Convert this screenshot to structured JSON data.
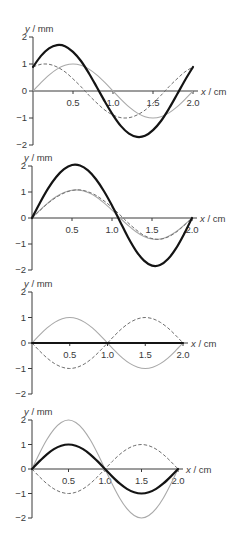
{
  "chart_data": [
    {
      "type": "line",
      "title": "",
      "xlabel": "x / cm",
      "ylabel": "y / mm",
      "xlim": [
        0,
        2.0
      ],
      "ylim": [
        -2,
        2
      ],
      "grid": false,
      "legend": null,
      "x_ticks": [
        0.5,
        1.0,
        1.5,
        2.0
      ],
      "x_tick_labels": [
        "0.5",
        "1.0",
        "1.5",
        "2.0"
      ],
      "y_ticks": [
        2,
        1,
        0,
        -1,
        -2
      ],
      "y_tick_labels": [
        "2",
        "1",
        "0",
        "−1",
        "−2"
      ],
      "x": [
        0,
        0.1,
        0.2,
        0.3,
        0.4,
        0.5,
        0.6,
        0.7,
        0.8,
        0.9,
        1.0,
        1.1,
        1.2,
        1.3,
        1.4,
        1.5,
        1.6,
        1.7,
        1.8,
        1.9,
        2.0
      ],
      "series": [
        {
          "name": "grey solid wave",
          "style": "grey-solid",
          "color": "#a9a9a9",
          "values": [
            0,
            0.31,
            0.59,
            0.81,
            0.95,
            1.0,
            0.95,
            0.81,
            0.59,
            0.31,
            0,
            -0.31,
            -0.59,
            -0.81,
            -0.95,
            -1.0,
            -0.95,
            -0.81,
            -0.59,
            -0.31,
            0
          ]
        },
        {
          "name": "dashed wave",
          "style": "dashed",
          "color": "#6f6f6f",
          "values": [
            0.89,
            0.99,
            0.99,
            0.89,
            0.71,
            0.45,
            0.16,
            -0.16,
            -0.45,
            -0.71,
            -0.89,
            -0.99,
            -0.99,
            -0.89,
            -0.71,
            -0.45,
            -0.16,
            0.16,
            0.45,
            0.71,
            0.89
          ]
        },
        {
          "name": "resultant (thick black)",
          "style": "thick",
          "color": "#141414",
          "values": [
            0.89,
            1.3,
            1.58,
            1.7,
            1.66,
            1.45,
            1.11,
            0.65,
            0.13,
            -0.4,
            -0.89,
            -1.3,
            -1.58,
            -1.7,
            -1.66,
            -1.45,
            -1.11,
            -0.65,
            -0.13,
            0.4,
            0.89
          ]
        }
      ]
    },
    {
      "type": "line",
      "title": "",
      "xlabel": "x / cm",
      "ylabel": "y / mm",
      "xlim": [
        0,
        2.0
      ],
      "ylim": [
        -2,
        2
      ],
      "grid": false,
      "legend": null,
      "x_ticks": [
        0.5,
        1.0,
        1.5,
        2.0
      ],
      "x_tick_labels": [
        "0.5",
        "1.0",
        "1.5",
        "2.0"
      ],
      "y_ticks": [
        2,
        1,
        0,
        -1,
        -2
      ],
      "y_tick_labels": [
        "2",
        "1",
        "0",
        "−1",
        "−2"
      ],
      "x": [
        0,
        0.1,
        0.2,
        0.3,
        0.4,
        0.5,
        0.6,
        0.7,
        0.8,
        0.9,
        1.0,
        1.1,
        1.2,
        1.3,
        1.4,
        1.5,
        1.6,
        1.7,
        1.8,
        1.9,
        2.0
      ],
      "series": [
        {
          "name": "grey solid wave",
          "style": "grey-solid",
          "color": "#a9a9a9",
          "values": [
            0,
            0.3,
            0.58,
            0.82,
            0.98,
            1.07,
            1.07,
            0.98,
            0.82,
            0.58,
            0.3,
            0,
            -0.28,
            -0.53,
            -0.71,
            -0.81,
            -0.81,
            -0.71,
            -0.53,
            -0.28,
            0
          ]
        },
        {
          "name": "dashed wave",
          "style": "dashed",
          "color": "#6f6f6f",
          "values": [
            0,
            0.29,
            0.57,
            0.79,
            0.96,
            1.06,
            1.08,
            1.01,
            0.87,
            0.66,
            0.41,
            0.12,
            -0.18,
            -0.45,
            -0.67,
            -0.79,
            -0.82,
            -0.73,
            -0.55,
            -0.29,
            0
          ]
        },
        {
          "name": "resultant (thick black)",
          "style": "thick",
          "color": "#141414",
          "values": [
            0,
            0.59,
            1.13,
            1.57,
            1.88,
            2.04,
            2.02,
            1.83,
            1.49,
            1.03,
            0.48,
            -0.13,
            -0.74,
            -1.26,
            -1.64,
            -1.83,
            -1.81,
            -1.58,
            -1.17,
            -0.62,
            0
          ]
        }
      ]
    },
    {
      "type": "line",
      "title": "",
      "xlabel": "x / cm",
      "ylabel": "y / mm",
      "xlim": [
        0,
        2.0
      ],
      "ylim": [
        -2,
        2
      ],
      "grid": false,
      "legend": null,
      "x_ticks": [
        0.5,
        1.0,
        1.5,
        2.0
      ],
      "x_tick_labels": [
        "0.5",
        "1.0",
        "1.5",
        "2.0"
      ],
      "y_ticks": [
        2,
        1,
        0,
        -1,
        -2
      ],
      "y_tick_labels": [
        "2",
        "1",
        "0",
        "−1",
        "−2"
      ],
      "x": [
        0,
        0.1,
        0.2,
        0.3,
        0.4,
        0.5,
        0.6,
        0.7,
        0.8,
        0.9,
        1.0,
        1.1,
        1.2,
        1.3,
        1.4,
        1.5,
        1.6,
        1.7,
        1.8,
        1.9,
        2.0
      ],
      "series": [
        {
          "name": "grey solid wave",
          "style": "grey-solid",
          "color": "#a9a9a9",
          "values": [
            0,
            0.31,
            0.59,
            0.81,
            0.95,
            1.0,
            0.95,
            0.81,
            0.59,
            0.31,
            0,
            -0.31,
            -0.59,
            -0.81,
            -0.95,
            -1.0,
            -0.95,
            -0.81,
            -0.59,
            -0.31,
            0
          ]
        },
        {
          "name": "dashed wave",
          "style": "dashed",
          "color": "#6f6f6f",
          "values": [
            0,
            -0.31,
            -0.59,
            -0.81,
            -0.95,
            -1.0,
            -0.95,
            -0.81,
            -0.59,
            -0.31,
            0,
            0.31,
            0.59,
            0.81,
            0.95,
            1.0,
            0.95,
            0.81,
            0.59,
            0.31,
            0
          ]
        },
        {
          "name": "resultant (thick black)",
          "style": "thick",
          "color": "#141414",
          "values": [
            0,
            0,
            0,
            0,
            0,
            0,
            0,
            0,
            0,
            0,
            0,
            0,
            0,
            0,
            0,
            0,
            0,
            0,
            0,
            0,
            0
          ]
        }
      ]
    },
    {
      "type": "line",
      "title": "",
      "xlabel": "x / cm",
      "ylabel": "y / mm",
      "xlim": [
        0,
        2.0
      ],
      "ylim": [
        -2,
        2
      ],
      "grid": false,
      "legend": null,
      "x_ticks": [
        0.5,
        1.0,
        1.5,
        2.0
      ],
      "x_tick_labels": [
        "0.5",
        "1.0",
        "1.5",
        "2.0"
      ],
      "y_ticks": [
        2,
        1,
        0,
        -1,
        -2
      ],
      "y_tick_labels": [
        "2",
        "1",
        "0",
        "−1",
        "−2"
      ],
      "x": [
        0,
        0.1,
        0.2,
        0.3,
        0.4,
        0.5,
        0.6,
        0.7,
        0.8,
        0.9,
        1.0,
        1.1,
        1.2,
        1.3,
        1.4,
        1.5,
        1.6,
        1.7,
        1.8,
        1.9,
        2.0
      ],
      "series": [
        {
          "name": "grey solid wave",
          "style": "grey-solid",
          "color": "#a9a9a9",
          "values": [
            0,
            0.62,
            1.18,
            1.62,
            1.9,
            2.0,
            1.9,
            1.62,
            1.18,
            0.62,
            0,
            -0.62,
            -1.18,
            -1.62,
            -1.9,
            -2.0,
            -1.9,
            -1.62,
            -1.18,
            -0.62,
            0
          ]
        },
        {
          "name": "dashed wave",
          "style": "dashed",
          "color": "#6f6f6f",
          "values": [
            0,
            -0.31,
            -0.59,
            -0.81,
            -0.95,
            -1.0,
            -0.95,
            -0.81,
            -0.59,
            -0.31,
            0,
            0.31,
            0.59,
            0.81,
            0.95,
            1.0,
            0.95,
            0.81,
            0.59,
            0.31,
            0
          ]
        },
        {
          "name": "resultant (thick black)",
          "style": "thick",
          "color": "#141414",
          "values": [
            0,
            0.31,
            0.59,
            0.81,
            0.95,
            1.0,
            0.95,
            0.81,
            0.59,
            0.31,
            0,
            -0.31,
            -0.59,
            -0.81,
            -0.95,
            -1.0,
            -0.95,
            -0.81,
            -0.59,
            -0.31,
            0
          ]
        }
      ]
    }
  ]
}
